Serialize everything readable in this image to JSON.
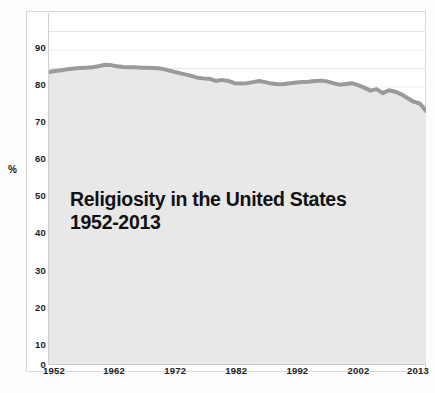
{
  "chart_data": {
    "type": "line",
    "title": "Religiosity in the United States",
    "subtitle": "1952-2013",
    "xlabel": "",
    "ylabel": "%",
    "ylim": [
      0,
      95
    ],
    "xlim": [
      1952,
      2013
    ],
    "grid": true,
    "legend": "none",
    "area_fill": true,
    "line_color": "#9a9a9a",
    "area_color": "#e8e8e8",
    "y_ticks": [
      0,
      10,
      20,
      30,
      40,
      50,
      60,
      70,
      80,
      90
    ],
    "x_ticks": [
      1952,
      1962,
      1972,
      1982,
      1992,
      2002,
      2013
    ],
    "series": [
      {
        "name": "Religiosity",
        "x": [
          1952,
          1953,
          1954,
          1955,
          1956,
          1957,
          1958,
          1959,
          1960,
          1961,
          1962,
          1963,
          1964,
          1965,
          1966,
          1967,
          1968,
          1969,
          1970,
          1971,
          1972,
          1973,
          1974,
          1975,
          1976,
          1977,
          1978,
          1979,
          1980,
          1981,
          1982,
          1983,
          1984,
          1985,
          1986,
          1987,
          1988,
          1989,
          1990,
          1991,
          1992,
          1993,
          1994,
          1995,
          1996,
          1997,
          1998,
          1999,
          2000,
          2001,
          2002,
          2003,
          2004,
          2005,
          2006,
          2007,
          2008,
          2009,
          2010,
          2011,
          2012,
          2013
        ],
        "values": [
          79.0,
          79.3,
          79.5,
          79.8,
          80.0,
          80.1,
          80.2,
          80.3,
          80.6,
          81.0,
          80.9,
          80.6,
          80.4,
          80.3,
          80.3,
          80.2,
          80.2,
          80.1,
          80.0,
          79.6,
          79.2,
          78.8,
          78.4,
          78.0,
          77.5,
          77.3,
          77.2,
          76.6,
          76.9,
          76.6,
          76.0,
          75.9,
          76.0,
          76.3,
          76.6,
          76.3,
          75.9,
          75.7,
          75.8,
          76.0,
          76.2,
          76.3,
          76.4,
          76.6,
          76.7,
          76.5,
          76.0,
          75.6,
          75.8,
          76.0,
          75.5,
          74.8,
          74.0,
          74.4,
          73.3,
          74.1,
          73.7,
          73.0,
          72.0,
          71.0,
          70.5,
          68.5
        ]
      }
    ]
  },
  "axes": {
    "y_unit_label": "%",
    "y_tick_labels": [
      "90",
      "80",
      "70",
      "60",
      "50",
      "40",
      "30",
      "20",
      "10",
      "0"
    ],
    "x_tick_labels": [
      "1952",
      "1962",
      "1972",
      "1982",
      "1992",
      "2002",
      "2013"
    ]
  },
  "title": {
    "line1": "Religiosity in the United States",
    "line2": "1952-2013"
  }
}
